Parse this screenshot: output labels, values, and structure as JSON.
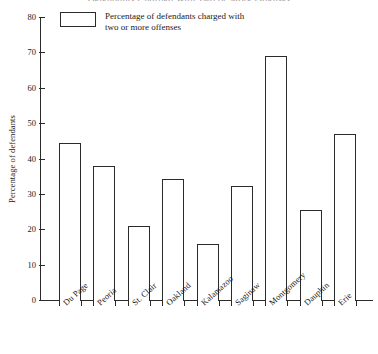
{
  "chart_data": {
    "type": "bar",
    "title": "Defendants Charged With Two or More Offenses",
    "xlabel": "",
    "ylabel": "Percentage of defendants",
    "ylim": [
      0,
      80
    ],
    "ytick_step": 10,
    "yticks": [
      "0",
      "10",
      "20",
      "30",
      "40",
      "50",
      "60",
      "70",
      "80"
    ],
    "grid": false,
    "legend_position": "top-left",
    "legend": [
      {
        "label_line1": "Percentage of defendants charged with",
        "label_line2": "two or more offenses",
        "swatch_fill": "#ffffff",
        "swatch_border": "#2b2b2b"
      }
    ],
    "categories": [
      "Du Page",
      "Peoria",
      "St. Clair",
      "Oakland",
      "Kalamazoo",
      "Saginaw",
      "Montgomery",
      "Dauphin",
      "Erie"
    ],
    "values": [
      44.8,
      38.2,
      21.2,
      34.5,
      16.1,
      32.5,
      69.2,
      25.8,
      47.3
    ]
  },
  "style": {
    "ink": "#2b2b2b",
    "background": "#ffffff",
    "title_color": "#9a9a9a"
  }
}
